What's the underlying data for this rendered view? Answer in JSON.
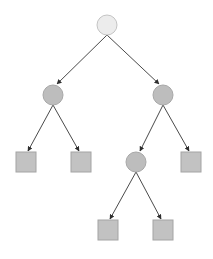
{
  "diagram": {
    "type": "binary-tree",
    "colors": {
      "root_fill": "#ececec",
      "root_stroke": "#c4c4c4",
      "node_fill": "#bdbdbd",
      "node_stroke": "#a8a8a8",
      "leaf_fill": "#c2c2c2",
      "leaf_stroke": "#a4a4a4",
      "edge": "#4a4a4a"
    },
    "nodes": [
      {
        "id": "root",
        "shape": "circle",
        "cx": 107,
        "cy": 25,
        "r": 10,
        "style": "root"
      },
      {
        "id": "n1",
        "shape": "circle",
        "cx": 53,
        "cy": 95,
        "r": 10,
        "style": "node"
      },
      {
        "id": "n2",
        "shape": "circle",
        "cx": 163,
        "cy": 95,
        "r": 10,
        "style": "node"
      },
      {
        "id": "l1",
        "shape": "square",
        "x": 16,
        "y": 152,
        "size": 20,
        "style": "leaf"
      },
      {
        "id": "l2",
        "shape": "square",
        "x": 71,
        "y": 152,
        "size": 20,
        "style": "leaf"
      },
      {
        "id": "n3",
        "shape": "circle",
        "cx": 136,
        "cy": 162,
        "r": 10,
        "style": "node"
      },
      {
        "id": "l3",
        "shape": "square",
        "x": 181,
        "y": 152,
        "size": 20,
        "style": "leaf"
      },
      {
        "id": "l4",
        "shape": "square",
        "x": 98,
        "y": 220,
        "size": 20,
        "style": "leaf"
      },
      {
        "id": "l5",
        "shape": "square",
        "x": 153,
        "y": 220,
        "size": 20,
        "style": "leaf"
      }
    ],
    "edges": [
      {
        "from": "root",
        "to": "n1",
        "x1": 107,
        "y1": 35,
        "x2": 57,
        "y2": 84
      },
      {
        "from": "root",
        "to": "n2",
        "x1": 107,
        "y1": 35,
        "x2": 159,
        "y2": 84
      },
      {
        "from": "n1",
        "to": "l1",
        "x1": 53,
        "y1": 105,
        "x2": 28,
        "y2": 151
      },
      {
        "from": "n1",
        "to": "l2",
        "x1": 53,
        "y1": 105,
        "x2": 79,
        "y2": 151
      },
      {
        "from": "n2",
        "to": "n3",
        "x1": 163,
        "y1": 105,
        "x2": 140,
        "y2": 151
      },
      {
        "from": "n2",
        "to": "l3",
        "x1": 163,
        "y1": 105,
        "x2": 189,
        "y2": 151
      },
      {
        "from": "n3",
        "to": "l4",
        "x1": 136,
        "y1": 172,
        "x2": 110,
        "y2": 219
      },
      {
        "from": "n3",
        "to": "l5",
        "x1": 136,
        "y1": 172,
        "x2": 161,
        "y2": 219
      }
    ]
  }
}
